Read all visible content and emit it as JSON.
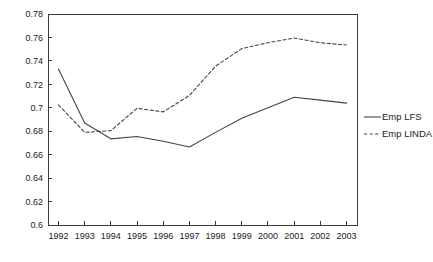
{
  "chart_data": {
    "type": "line",
    "title": "",
    "xlabel": "",
    "ylabel": "",
    "x": [
      1992,
      1993,
      1994,
      1995,
      1996,
      1997,
      1998,
      1999,
      2000,
      2001,
      2002,
      2003
    ],
    "xticklabels": [
      "1992",
      "1993",
      "1994",
      "1995",
      "1996",
      "1997",
      "1998",
      "1999",
      "2000",
      "2001",
      "2002",
      "2003"
    ],
    "yticks": [
      0.6,
      0.62,
      0.64,
      0.66,
      0.68,
      0.7,
      0.72,
      0.74,
      0.76,
      0.78
    ],
    "yticklabels": [
      "0.6",
      "0.62",
      "0.64",
      "0.66",
      "0.68",
      "0.7",
      "0.72",
      "0.74",
      "0.76",
      "0.78"
    ],
    "ylim": [
      0.6,
      0.78
    ],
    "xlim": [
      1991.6,
      2003.4
    ],
    "grid": false,
    "legend_position": "right-outside",
    "series": [
      {
        "name": "Emp LFS",
        "style": "solid",
        "color": "#444444",
        "values": [
          0.733,
          0.687,
          0.6735,
          0.6755,
          0.6715,
          0.6665,
          0.679,
          0.691,
          0.7,
          0.709,
          0.7065,
          0.704
        ]
      },
      {
        "name": "Emp LINDA",
        "style": "dashed",
        "color": "#444444",
        "values": [
          0.7025,
          0.679,
          0.6805,
          0.6995,
          0.6965,
          0.7105,
          0.7355,
          0.7505,
          0.7555,
          0.7595,
          0.7555,
          0.7535
        ]
      }
    ]
  },
  "legend": {
    "items": [
      {
        "label": "Emp LFS",
        "style": "solid"
      },
      {
        "label": "Emp LINDA",
        "style": "dashed"
      }
    ]
  }
}
